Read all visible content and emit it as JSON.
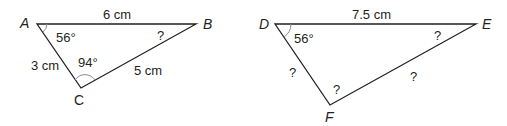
{
  "triangle1": {
    "vertices": {
      "A": "A",
      "B": "B",
      "C": "C"
    },
    "sides": {
      "AB": "6 cm",
      "AC": "3 cm",
      "BC": "5 cm"
    },
    "angles": {
      "A": "56°",
      "C": "94°",
      "B": "?"
    }
  },
  "triangle2": {
    "vertices": {
      "D": "D",
      "E": "E",
      "F": "F"
    },
    "sides": {
      "DE": "7.5 cm",
      "DF": "?",
      "EF": "?"
    },
    "angles": {
      "D": "56°",
      "E": "?",
      "F": "?"
    }
  }
}
